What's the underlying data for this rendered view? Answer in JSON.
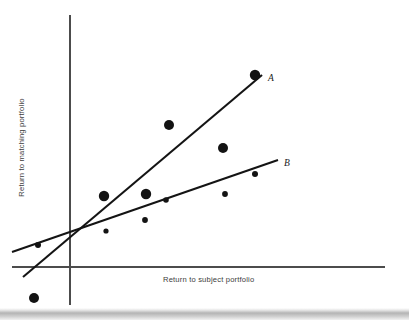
{
  "figure": {
    "width": 409,
    "height": 320,
    "background_color": "#ffffff",
    "bottom_band_color": "#b4b4b4"
  },
  "labels": {
    "x_axis_title": "Return to subject portfolio",
    "y_axis_title": "Return to matching portfolio",
    "line_a_label": "A",
    "line_b_label": "B"
  },
  "chart_data": {
    "type": "scatter",
    "title": "",
    "xlabel": "Return to subject portfolio",
    "ylabel": "Return to matching portfolio",
    "grid": false,
    "legend_position": "inline-end-of-line",
    "axis_style": {
      "x_axis_y_px": 267,
      "x_axis_x_start_px": 12,
      "x_axis_x_end_px": 385,
      "y_axis_x_px": 70,
      "y_axis_y_start_px": 15,
      "y_axis_y_end_px": 305,
      "ticks": [],
      "tick_labels": [],
      "color": "#4c4c4c"
    },
    "points": [
      {
        "name": "p1",
        "x_px": 34,
        "y_px": 298,
        "r_px": 5.0
      },
      {
        "name": "p2",
        "x_px": 38,
        "y_px": 245,
        "r_px": 3.0
      },
      {
        "name": "p3",
        "x_px": 106,
        "y_px": 231,
        "r_px": 2.6
      },
      {
        "name": "p4",
        "x_px": 104,
        "y_px": 196,
        "r_px": 5.2
      },
      {
        "name": "p5",
        "x_px": 145,
        "y_px": 220,
        "r_px": 2.9
      },
      {
        "name": "p6",
        "x_px": 146,
        "y_px": 194,
        "r_px": 5.2
      },
      {
        "name": "p7",
        "x_px": 166,
        "y_px": 200,
        "r_px": 2.8
      },
      {
        "name": "p8",
        "x_px": 169,
        "y_px": 125,
        "r_px": 5.0
      },
      {
        "name": "p9",
        "x_px": 225,
        "y_px": 194,
        "r_px": 2.9
      },
      {
        "name": "p10",
        "x_px": 223,
        "y_px": 148,
        "r_px": 5.0
      },
      {
        "name": "p11",
        "x_px": 255,
        "y_px": 174,
        "r_px": 3.0
      },
      {
        "name": "p12",
        "x_px": 255,
        "y_px": 75,
        "r_px": 5.2
      }
    ],
    "series": [
      {
        "name": "A",
        "type": "line",
        "label": "A",
        "slope_description": "steep positive",
        "x1_px": 23,
        "y1_px": 277,
        "x2_px": 262,
        "y2_px": 75,
        "label_x_px": 268,
        "label_y_px": 81,
        "color": "#141414"
      },
      {
        "name": "B",
        "type": "line",
        "label": "B",
        "slope_description": "shallow positive",
        "x1_px": 12,
        "y1_px": 252,
        "x2_px": 278,
        "y2_px": 160,
        "label_x_px": 284,
        "label_y_px": 166,
        "color": "#141414"
      }
    ]
  }
}
